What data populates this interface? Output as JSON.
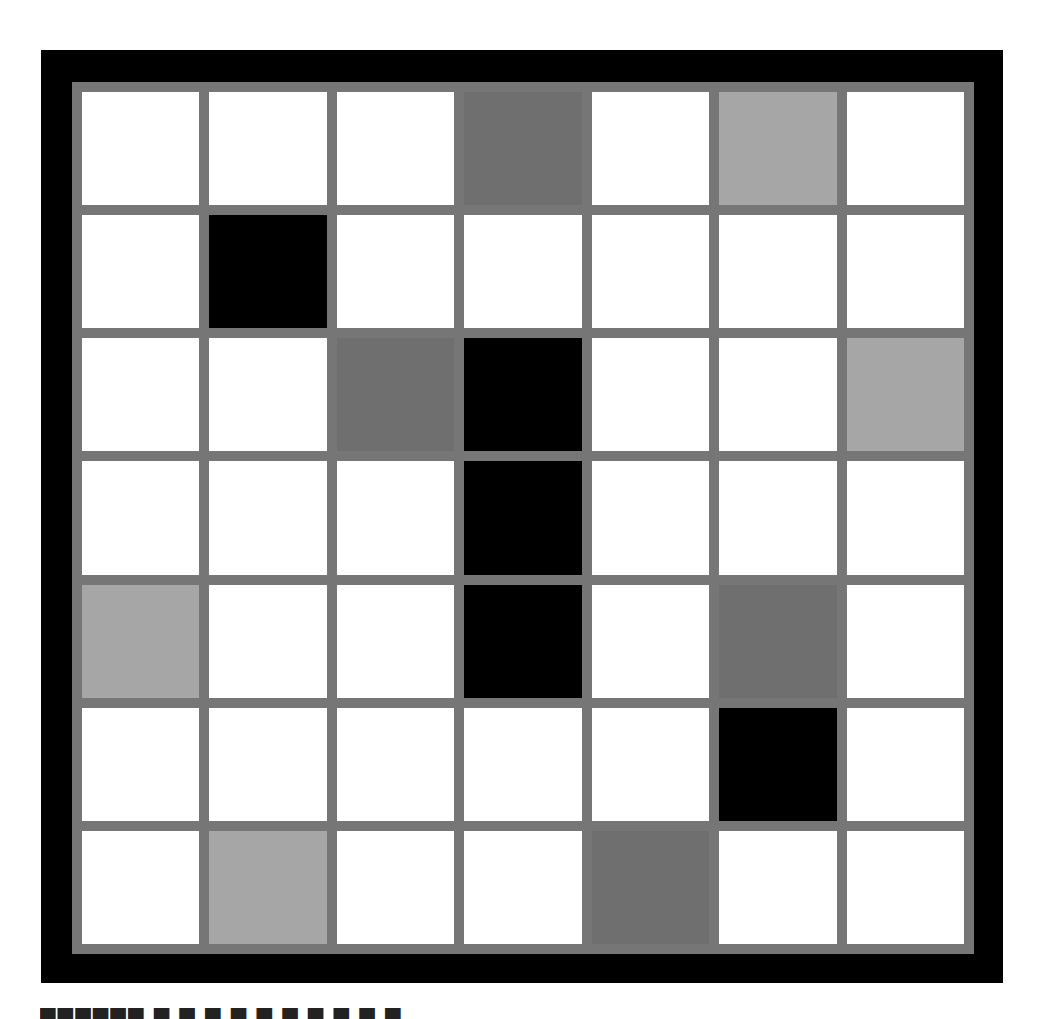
{
  "puzzle": {
    "rows": 7,
    "cols": 7,
    "colors": {
      "white": "#ffffff",
      "black": "#000000",
      "dark": "#6f6f6f",
      "light": "#a6a6a6",
      "gridline": "#767676",
      "frame": "#000000"
    },
    "grid": [
      [
        "white",
        "white",
        "white",
        "dark",
        "white",
        "light",
        "white"
      ],
      [
        "white",
        "black",
        "white",
        "white",
        "white",
        "white",
        "white"
      ],
      [
        "white",
        "white",
        "dark",
        "black",
        "white",
        "white",
        "light"
      ],
      [
        "white",
        "white",
        "white",
        "black",
        "white",
        "white",
        "white"
      ],
      [
        "light",
        "white",
        "white",
        "black",
        "white",
        "dark",
        "white"
      ],
      [
        "white",
        "white",
        "white",
        "white",
        "white",
        "black",
        "white"
      ],
      [
        "white",
        "light",
        "white",
        "white",
        "dark",
        "white",
        "white"
      ]
    ]
  },
  "caption": {
    "text": "▀▀▀▀▀▀  ▀  ▀ ▀ ▀ ▀ ▀ ▀ ▀ ▀ ▀"
  }
}
